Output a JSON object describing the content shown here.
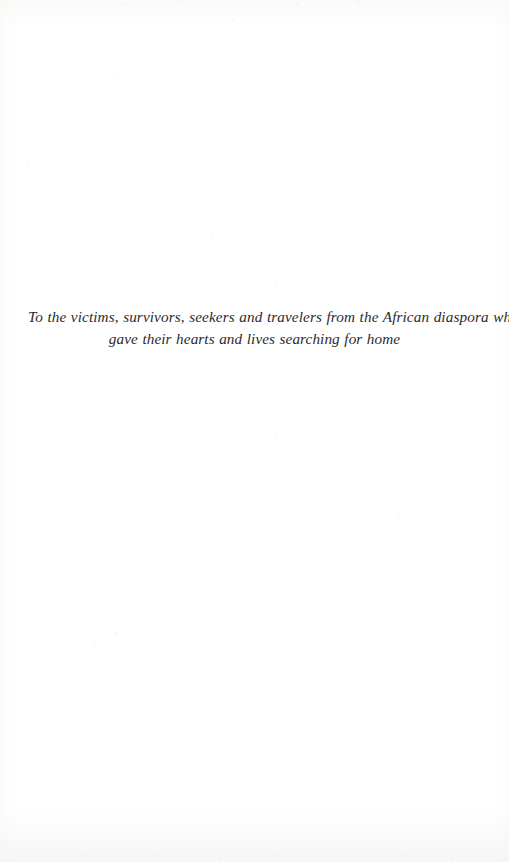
{
  "page": {
    "kind": "book-dedication-page",
    "background_color": "#ffffff",
    "text_color": "#2a2a2e",
    "width": 509,
    "height": 862
  },
  "dedication": {
    "full_text": "To the victims, survivors, seekers and travelers from the African diaspora who gave their hearts and lives searching for home",
    "line_1": "To the victims, survivors, seekers and travelers from the African diaspora who",
    "line_2": "gave their hearts and lives searching for home",
    "alignment": "center",
    "style": "italic"
  }
}
